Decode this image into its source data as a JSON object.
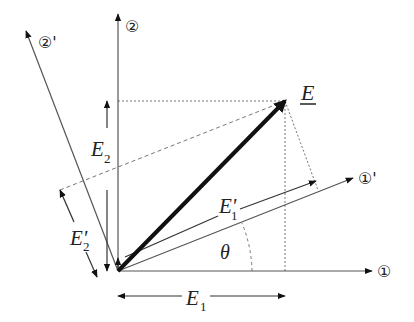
{
  "diagram": {
    "title": "",
    "type": "vector-rotation-of-axes",
    "axes": {
      "axis1": {
        "label": "①"
      },
      "axis2": {
        "label": "②"
      },
      "axis1_rotated": {
        "label": "①'"
      },
      "axis2_rotated": {
        "label": "②'"
      }
    },
    "vector": {
      "label": "E",
      "underlined": true
    },
    "components": {
      "E1": {
        "label": "E",
        "sub": "1"
      },
      "E2": {
        "label": "E",
        "sub": "2"
      },
      "E1_prime": {
        "label": "E'",
        "sub": "1"
      },
      "E2_prime": {
        "label": "E'",
        "sub": "2"
      }
    },
    "angle": {
      "label": "θ"
    },
    "colors": {
      "line": "#555555",
      "vector": "#111111",
      "dotted": "#777777"
    }
  }
}
